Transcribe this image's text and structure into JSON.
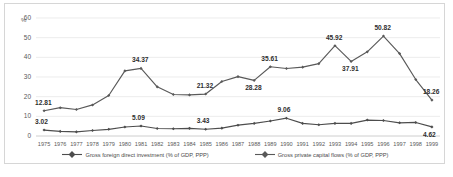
{
  "chart_data": {
    "type": "line",
    "title": "",
    "subtitle": "",
    "xlabel": "",
    "ylabel": "%",
    "ylim": [
      0,
      60
    ],
    "yticks": [
      0,
      10,
      20,
      30,
      40,
      50,
      60
    ],
    "grid": true,
    "legend_position": "bottom",
    "categories": [
      "1975",
      "1976",
      "1977",
      "1978",
      "1979",
      "1980",
      "1981",
      "1982",
      "1983",
      "1984",
      "1985",
      "1986",
      "1987",
      "1988",
      "1989",
      "1990",
      "1991",
      "1992",
      "1993",
      "1994",
      "1995",
      "1996",
      "1997",
      "1998",
      "1999"
    ],
    "series": [
      {
        "name": "Gross private capital flows (% of GDP, PPP)",
        "color": "#595959",
        "values": [
          12.81,
          14.4,
          13.5,
          15.8,
          20.6,
          33.1,
          34.37,
          25.0,
          21.1,
          20.9,
          21.32,
          27.7,
          30.2,
          28.28,
          35.2,
          34.3,
          35.0,
          36.8,
          45.92,
          37.91,
          42.8,
          50.82,
          41.9,
          28.7,
          18.26
        ]
      },
      {
        "name": "Gross foreign direct investment (% of GDP, PPP)",
        "color": "#4d4d4d",
        "values": [
          3.02,
          2.35,
          2.1,
          2.8,
          3.4,
          4.6,
          5.09,
          3.8,
          3.7,
          3.9,
          3.43,
          4.0,
          5.5,
          6.4,
          7.6,
          9.06,
          6.4,
          5.7,
          6.4,
          6.4,
          8.1,
          7.9,
          6.7,
          6.9,
          4.62
        ]
      }
    ],
    "data_labels": [
      {
        "series": 0,
        "category": "1975",
        "value": "12.81"
      },
      {
        "series": 0,
        "category": "1981",
        "value": "34.37"
      },
      {
        "series": 0,
        "category": "1985",
        "value": "21.32"
      },
      {
        "series": 0,
        "category": "1988",
        "value": "28.28"
      },
      {
        "series": 0,
        "category": "1989",
        "value": "35.61"
      },
      {
        "series": 0,
        "category": "1993",
        "value": "45.92"
      },
      {
        "series": 0,
        "category": "1994",
        "value": "37.91"
      },
      {
        "series": 0,
        "category": "1996",
        "value": "50.82"
      },
      {
        "series": 0,
        "category": "1999",
        "value": "18.26"
      },
      {
        "series": 1,
        "category": "1975",
        "value": "3.02"
      },
      {
        "series": 1,
        "category": "1981",
        "value": "5.09"
      },
      {
        "series": 1,
        "category": "1985",
        "value": "3.43"
      },
      {
        "series": 1,
        "category": "1990",
        "value": "9.06"
      },
      {
        "series": 1,
        "category": "1999",
        "value": "4.62"
      }
    ]
  },
  "axis": {
    "unit_label": "%",
    "ytick_labels": [
      "60",
      "50",
      "40",
      "30",
      "20",
      "10",
      "0"
    ],
    "xtick_labels": [
      "1975",
      "1976",
      "1977",
      "1978",
      "1979",
      "1980",
      "1981",
      "1982",
      "1983",
      "1984",
      "1985",
      "1986",
      "1987",
      "1988",
      "1989",
      "1990",
      "1991",
      "1992",
      "1993",
      "1994",
      "1995",
      "1996",
      "1997",
      "1998",
      "1999"
    ]
  },
  "legend": {
    "items": [
      {
        "label": "Gross foreign direct investment (% of GDP, PPP)"
      },
      {
        "label": "Gross private capital flows (% of GDP, PPP)"
      }
    ]
  }
}
